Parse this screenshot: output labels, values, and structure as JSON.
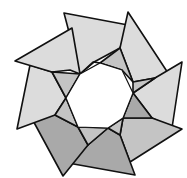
{
  "image": {
    "subject": "origami ring illustration",
    "description": "Eight folded triangular paper units forming an octagonal ring with a hollow center",
    "unit_count": 8,
    "colors": {
      "paper_light": "#dcdcdc",
      "paper_mid": "#c4c4c4",
      "paper_dark": "#a9a9a9",
      "outline": "#111111",
      "background": "#ffffff"
    }
  }
}
